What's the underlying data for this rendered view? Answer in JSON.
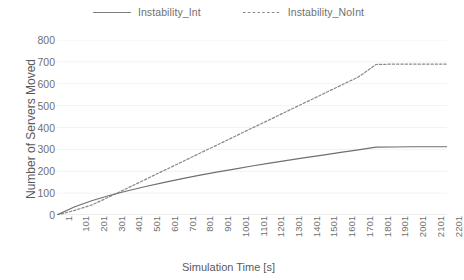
{
  "chart_data": {
    "type": "line",
    "title": "",
    "xlabel": "Simulation Time [s]",
    "ylabel": "Number of Servers Moved",
    "xlim": [
      1,
      2201
    ],
    "ylim": [
      0,
      800
    ],
    "grid": true,
    "legend_position": "top-center",
    "y_ticks": [
      800,
      700,
      600,
      500,
      400,
      300,
      200,
      100,
      0
    ],
    "categories": [
      1,
      101,
      201,
      301,
      401,
      501,
      601,
      701,
      801,
      901,
      1001,
      1101,
      1201,
      1301,
      1401,
      1501,
      1601,
      1701,
      1801,
      1901,
      2001,
      2101,
      2201
    ],
    "series": [
      {
        "name": "Instability_Int",
        "style": "solid",
        "color": "#7f7f7f",
        "values": [
          0,
          38,
          66,
          90,
          111,
          130,
          148,
          165,
          181,
          196,
          210,
          224,
          237,
          250,
          262,
          274,
          286,
          298,
          310,
          311,
          312,
          312,
          312
        ]
      },
      {
        "name": "Instability_NoInt",
        "style": "dotted",
        "color": "#7f7f7f",
        "values": [
          0,
          21,
          47,
          85,
          124,
          163,
          202,
          241,
          280,
          319,
          358,
          397,
          436,
          475,
          514,
          553,
          592,
          631,
          688,
          690,
          690,
          690,
          690
        ]
      }
    ]
  },
  "legend": {
    "entries": [
      {
        "label": "Instability_Int"
      },
      {
        "label": "Instability_NoInt"
      }
    ]
  },
  "axes": {
    "y_title": "Number of Servers Moved",
    "x_title": "Simulation Time [s]"
  },
  "colors": {
    "line": "#7f7f7f",
    "grid": "#f2f2f2",
    "text": "#707070",
    "background": "#ffffff"
  }
}
